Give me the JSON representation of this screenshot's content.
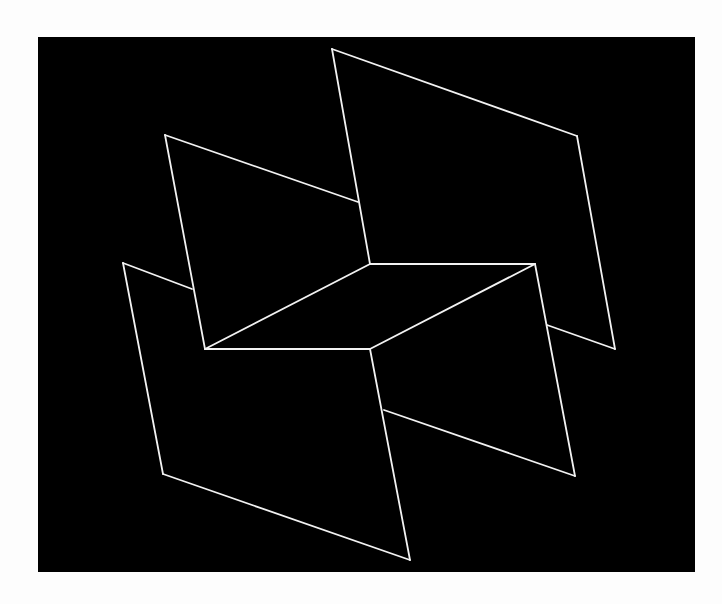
{
  "artwork": {
    "colors": {
      "paper": "#fdfdfd",
      "ground": "#000000",
      "line": "#f2f2f2"
    },
    "frame": {
      "x": 38,
      "y": 37,
      "width": 657,
      "height": 535
    },
    "stroke_width": 1.8,
    "segments": [
      {
        "name": "top-right-plane-top-edge",
        "x1": 332,
        "y1": 49,
        "x2": 577,
        "y2": 136
      },
      {
        "name": "top-right-plane-right-edge",
        "x1": 577,
        "y1": 136,
        "x2": 615,
        "y2": 349
      },
      {
        "name": "top-right-plane-bottom-edge",
        "x1": 547,
        "y1": 325,
        "x2": 615,
        "y2": 349
      },
      {
        "name": "top-right-plane-left-edge",
        "x1": 332,
        "y1": 49,
        "x2": 370,
        "y2": 264
      },
      {
        "name": "top-left-plane-top-edge",
        "x1": 165,
        "y1": 135,
        "x2": 358,
        "y2": 202
      },
      {
        "name": "top-left-plane-left-edge",
        "x1": 165,
        "y1": 135,
        "x2": 205,
        "y2": 349
      },
      {
        "name": "center-rhombus-top-edge",
        "x1": 370,
        "y1": 264,
        "x2": 535,
        "y2": 264
      },
      {
        "name": "center-rhombus-left-edge",
        "x1": 370,
        "y1": 264,
        "x2": 205,
        "y2": 349
      },
      {
        "name": "center-rhombus-bottom-edge",
        "x1": 205,
        "y1": 349,
        "x2": 370,
        "y2": 349
      },
      {
        "name": "center-rhombus-right-edge",
        "x1": 535,
        "y1": 264,
        "x2": 370,
        "y2": 349
      },
      {
        "name": "bottom-right-plane-right-edge",
        "x1": 535,
        "y1": 264,
        "x2": 575,
        "y2": 476
      },
      {
        "name": "bottom-right-plane-bottom-edge",
        "x1": 384,
        "y1": 410,
        "x2": 575,
        "y2": 476
      },
      {
        "name": "bottom-left-plane-top-edge",
        "x1": 123,
        "y1": 263,
        "x2": 192,
        "y2": 289
      },
      {
        "name": "bottom-left-plane-left-edge",
        "x1": 123,
        "y1": 263,
        "x2": 163,
        "y2": 474
      },
      {
        "name": "bottom-left-plane-bottom-edge",
        "x1": 163,
        "y1": 474,
        "x2": 410,
        "y2": 560
      },
      {
        "name": "bottom-left-plane-right-edge",
        "x1": 370,
        "y1": 349,
        "x2": 410,
        "y2": 560
      }
    ]
  }
}
